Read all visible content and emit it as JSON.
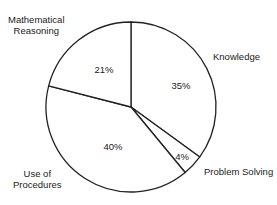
{
  "chart_data": {
    "type": "pie",
    "title": "",
    "start_angle_deg": 0,
    "direction": "clockwise",
    "slices": [
      {
        "label": "Knowledge",
        "value": 35,
        "display": "35%"
      },
      {
        "label": "Problem Solving",
        "value": 4,
        "display": "4%"
      },
      {
        "label": "Use of Procedures",
        "value": 40,
        "display": "40%"
      },
      {
        "label": "Mathematical Reasoning",
        "value": 21,
        "display": "21%"
      }
    ],
    "categories": [
      "Knowledge",
      "Problem Solving",
      "Use of Procedures",
      "Mathematical Reasoning"
    ],
    "values": [
      35,
      4,
      40,
      21
    ],
    "fill_color": "#ffffff",
    "stroke_color": "#222222",
    "legend": "none (external labels)"
  },
  "labels": {
    "knowledge": "Knowledge",
    "problem_solving": "Problem Solving",
    "procedures_line1": "Use of",
    "procedures_line2": "Procedures",
    "reasoning_line1": "Mathematical",
    "reasoning_line2": "Reasoning"
  },
  "percents": {
    "knowledge": "35%",
    "problem_solving": "4%",
    "procedures": "40%",
    "reasoning": "21%"
  }
}
